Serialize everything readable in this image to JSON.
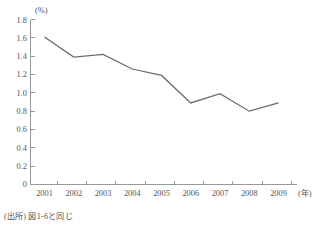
{
  "chart_data": {
    "type": "line",
    "title": "",
    "subtitle": "",
    "xlabel": "(年)",
    "ylabel": "(%)",
    "categories": [
      "2001",
      "2002",
      "2003",
      "2004",
      "2005",
      "2006",
      "2007",
      "2008",
      "2009"
    ],
    "x": [
      2001,
      2002,
      2003,
      2004,
      2005,
      2006,
      2007,
      2008,
      2009
    ],
    "values": [
      1.61,
      1.39,
      1.42,
      1.26,
      1.19,
      0.89,
      0.99,
      0.8,
      0.89
    ],
    "series": [
      {
        "name": "",
        "values": [
          1.61,
          1.39,
          1.42,
          1.26,
          1.19,
          0.89,
          0.99,
          0.8,
          0.89
        ]
      }
    ],
    "ylim": [
      0,
      1.8
    ],
    "yticks": [
      0,
      0.2,
      0.4,
      0.6,
      0.8,
      1.0,
      1.2,
      1.4,
      1.6,
      1.8
    ],
    "ytick_labels": [
      "0",
      "0.2",
      "0.4",
      "0.6",
      "0.8",
      "1.0",
      "1.2",
      "1.4",
      "1.6",
      "1.8"
    ],
    "xtick_labels": [
      "2001",
      "2002",
      "2003",
      "2004",
      "2005",
      "2006",
      "2007",
      "2008",
      "2009"
    ],
    "grid": false,
    "legend": "none",
    "line_color": "#6b6b6b",
    "axis_color": "#8d8d8d"
  },
  "axes": {
    "y_unit_label": "(%)",
    "x_unit_label": "(年)"
  },
  "footer": {
    "source_note": "(出所) 図1-6と同じ"
  }
}
